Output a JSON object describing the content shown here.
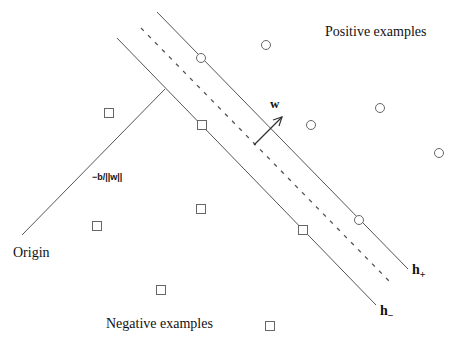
{
  "diagram": {
    "labels": {
      "positive": "Positive examples",
      "negative": "Negative examples",
      "origin": "Origin",
      "offset": "−b/||w||",
      "w": "w",
      "h_plus": "h",
      "h_plus_sub": "+",
      "h_minus": "h",
      "h_minus_sub": "−"
    },
    "lines": {
      "h_plus": {
        "x1": 157,
        "y1": 12,
        "x2": 408,
        "y2": 269,
        "style": "solid"
      },
      "margin_center": {
        "x1": 141,
        "y1": 28,
        "x2": 391,
        "y2": 283,
        "style": "dashed"
      },
      "h_minus": {
        "x1": 117,
        "y1": 38,
        "x2": 376,
        "y2": 305,
        "style": "solid"
      },
      "perpendicular": {
        "x1": 22,
        "y1": 235,
        "x2": 165,
        "y2": 89,
        "style": "solid"
      },
      "w_vector": {
        "x1": 254,
        "y1": 145,
        "x2": 282,
        "y2": 117
      }
    },
    "positive_points": [
      [
        201,
        58
      ],
      [
        266,
        45
      ],
      [
        311,
        125
      ],
      [
        380,
        108
      ],
      [
        439,
        153
      ],
      [
        359,
        220
      ]
    ],
    "negative_points": [
      [
        109,
        113
      ],
      [
        202,
        125
      ],
      [
        97,
        226
      ],
      [
        201,
        209
      ],
      [
        303,
        230
      ],
      [
        161,
        290
      ],
      [
        270,
        326
      ]
    ],
    "colors": {
      "stroke": "#555555",
      "text": "#111111",
      "background": "#ffffff"
    }
  }
}
